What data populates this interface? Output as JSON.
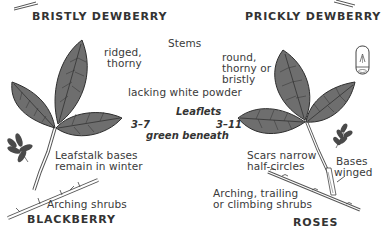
{
  "titles": {
    "top_left": "BRISTLY DEWBERRY",
    "top_right": "PRICKLY DEWBERRY",
    "bottom_left": "BLACKBERRY",
    "bottom_right": "ROSES"
  },
  "stems": {
    "heading": "Stems",
    "left": [
      "ridged,",
      "thorny"
    ],
    "right": [
      "round,",
      "thorny or",
      "bristly"
    ],
    "shared": "lacking white powder"
  },
  "leaflets": {
    "heading": "Leaflets",
    "left_count": "3–7",
    "right_count": "3–11",
    "shared": "green beneath"
  },
  "left_notes": {
    "leafstalk": [
      "Leafstalk bases",
      "remain in winter"
    ],
    "habit": "Arching shrubs"
  },
  "right_notes": {
    "scars": [
      "Scars narrow",
      "half-circles"
    ],
    "bases": [
      "Bases",
      "winged"
    ],
    "habit": [
      "Arching, trailing",
      "or climbing shrubs"
    ]
  },
  "colors": {
    "leaf_fill": "#6e6e6e",
    "leaf_edge": "#2e2e2e",
    "vein": "#2a2a2a",
    "stem": "#555555",
    "text": "#3a3a3a",
    "background": "#ffffff"
  }
}
